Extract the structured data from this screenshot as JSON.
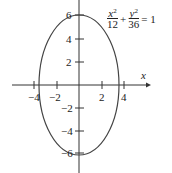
{
  "diagram": {
    "type": "ellipse-graph",
    "equation": {
      "a_num": "x",
      "a_den": "12",
      "b_num": "y",
      "b_den": "36",
      "exp": "2",
      "plus": "+",
      "equals": "= 1"
    },
    "axes": {
      "x_label": "x",
      "y_label": "y"
    },
    "x_ticks": [
      {
        "v": -4,
        "label": "−4"
      },
      {
        "v": -2,
        "label": "−2"
      },
      {
        "v": 2,
        "label": "2"
      },
      {
        "v": 4,
        "label": "4"
      }
    ],
    "y_ticks": [
      {
        "v": 6,
        "label": "6"
      },
      {
        "v": 4,
        "label": "4"
      },
      {
        "v": 2,
        "label": "2"
      },
      {
        "v": -2,
        "label": "−2"
      },
      {
        "v": -4,
        "label": "−4"
      },
      {
        "v": -6,
        "label": "−6"
      }
    ],
    "ellipse": {
      "semi_x": 3.464,
      "semi_y": 6
    },
    "colors": {
      "stroke": "#333333"
    }
  }
}
